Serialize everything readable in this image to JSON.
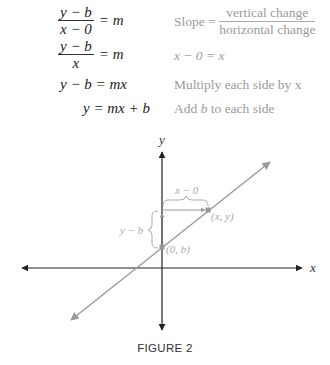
{
  "derivation": {
    "steps": [
      {
        "lhs_num": "y − b",
        "lhs_den": "x − 0",
        "rhs": "= m",
        "note_prefix": "Slope = ",
        "note_num": "vertical change",
        "note_den": "horizontal change"
      },
      {
        "lhs_num": "y − b",
        "lhs_den": "x",
        "rhs": "= m",
        "note": "x − 0 = x"
      },
      {
        "equation": "y − b = mx",
        "note": "Multiply each side by x"
      },
      {
        "equation": "y = mx + b",
        "note_before": "Add ",
        "note_var": "b",
        "note_after": " to each side"
      }
    ]
  },
  "figure": {
    "x_axis_label": "x",
    "y_axis_label": "y",
    "point_intercept_label": "(0, b)",
    "point_general_label": "(x, y)",
    "horizontal_change_label": "x − 0",
    "vertical_change_label": "y − b",
    "caption": "FIGURE 2",
    "colors": {
      "axis": "#222222",
      "line": "#9a9a9a",
      "annotation": "#aaaaaa"
    }
  }
}
